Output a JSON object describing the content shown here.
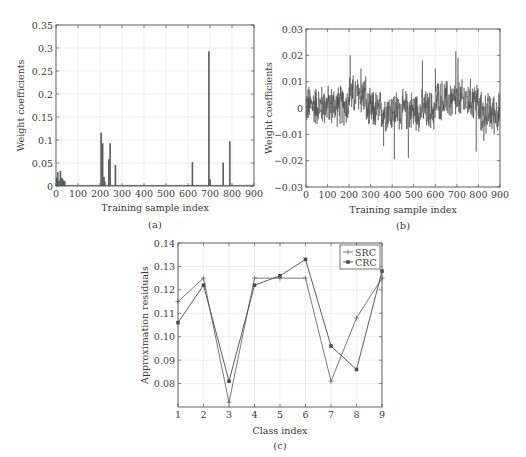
{
  "chart_data": [
    {
      "id": "a",
      "type": "bar",
      "caption": "(a)",
      "xlabel": "Training sample index",
      "ylabel": "Weight coefficients",
      "xlim": [
        0,
        900
      ],
      "ylim": [
        0,
        0.35
      ],
      "xticks": [
        0,
        100,
        200,
        300,
        400,
        500,
        600,
        700,
        800,
        900
      ],
      "yticks": [
        0,
        0.05,
        0.1,
        0.15,
        0.2,
        0.25,
        0.3,
        0.35
      ],
      "ytick_labels": [
        "0",
        "0.05",
        "0.1",
        "0.15",
        "0.2",
        "0.25",
        "0.3",
        "0.35"
      ],
      "grid": true,
      "x": [
        3,
        8,
        14,
        20,
        25,
        30,
        35,
        40,
        205,
        212,
        218,
        222,
        240,
        246,
        270,
        620,
        695,
        700,
        760,
        790
      ],
      "values": [
        0.018,
        0.03,
        0.012,
        0.033,
        0.018,
        0.016,
        0.012,
        0.01,
        0.116,
        0.093,
        0.02,
        0.01,
        0.058,
        0.093,
        0.046,
        0.052,
        0.293,
        0.015,
        0.051,
        0.097
      ]
    },
    {
      "id": "b",
      "type": "line",
      "caption": "(b)",
      "xlabel": "Training sample index",
      "ylabel": "Weight coefficients",
      "xlim": [
        0,
        900
      ],
      "ylim": [
        -0.03,
        0.03
      ],
      "xticks": [
        0,
        100,
        200,
        300,
        400,
        500,
        600,
        700,
        800,
        900
      ],
      "yticks": [
        -0.03,
        -0.02,
        -0.01,
        0,
        0.01,
        0.02,
        0.03
      ],
      "ytick_labels": [
        "−0.03",
        "−0.02",
        "−0.01",
        "0",
        "0.01",
        "0.02",
        "0.03"
      ],
      "grid": true,
      "n_points": 900,
      "noise_amplitude": 0.006,
      "segment_means": [
        {
          "from": 0,
          "to": 200,
          "mean": 0.001
        },
        {
          "from": 200,
          "to": 280,
          "mean": 0.005
        },
        {
          "from": 280,
          "to": 600,
          "mean": -0.001
        },
        {
          "from": 600,
          "to": 800,
          "mean": 0.003
        },
        {
          "from": 800,
          "to": 900,
          "mean": -0.002
        }
      ],
      "spikes": [
        {
          "x": 205,
          "y": 0.02
        },
        {
          "x": 255,
          "y": 0.015
        },
        {
          "x": 410,
          "y": -0.0195
        },
        {
          "x": 475,
          "y": -0.019
        },
        {
          "x": 540,
          "y": 0.018
        },
        {
          "x": 600,
          "y": -0.0265
        },
        {
          "x": 600,
          "y": 0.015
        },
        {
          "x": 695,
          "y": 0.0215
        },
        {
          "x": 705,
          "y": 0.019
        },
        {
          "x": 790,
          "y": -0.0165
        },
        {
          "x": 360,
          "y": -0.0145
        },
        {
          "x": 825,
          "y": -0.0125
        }
      ]
    },
    {
      "id": "c",
      "type": "line",
      "caption": "(c)",
      "xlabel": "Class index",
      "ylabel": "Approximation residuals",
      "xlim": [
        1,
        9
      ],
      "ylim": [
        0.07,
        0.14
      ],
      "xticks": [
        1,
        2,
        3,
        4,
        5,
        6,
        7,
        8,
        9
      ],
      "yticks": [
        0.08,
        0.09,
        0.1,
        0.11,
        0.12,
        0.13,
        0.14
      ],
      "ytick_labels": [
        "0.08",
        "0.09",
        "0.10",
        "0.11",
        "0.12",
        "0.13",
        "0.14"
      ],
      "grid": true,
      "legend_position": "upper right",
      "categories": [
        1,
        2,
        3,
        4,
        5,
        6,
        7,
        8,
        9
      ],
      "series": [
        {
          "name": "SRC",
          "marker": "plus",
          "color": "#6a6a6a",
          "values": [
            0.115,
            0.125,
            0.072,
            0.125,
            0.125,
            0.125,
            0.081,
            0.108,
            0.125
          ]
        },
        {
          "name": "CRC",
          "marker": "square",
          "color": "#4a4a4a",
          "values": [
            0.106,
            0.122,
            0.081,
            0.122,
            0.126,
            0.133,
            0.096,
            0.086,
            0.128
          ]
        }
      ]
    }
  ],
  "colors": {
    "axis": "#555555",
    "grid": "#e2e2e2",
    "bar": "#5a5a5a",
    "noise_line": "#4a4a4a",
    "text": "#3a3a3a"
  }
}
